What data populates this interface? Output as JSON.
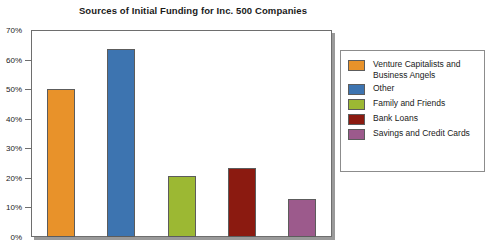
{
  "chart_data": {
    "type": "bar",
    "title": "Sources of Initial Funding for Inc. 500 Companies",
    "xlabel": "",
    "ylabel": "",
    "ylim": [
      0,
      70
    ],
    "grid": false,
    "legend_position": "right",
    "categories": [
      "Venture Capitalists and Business Angels",
      "Other",
      "Family and Friends",
      "Bank Loans",
      "Savings and Credit Cards"
    ],
    "values": [
      50,
      63.5,
      20.5,
      23.5,
      13
    ],
    "colors": [
      "#E8922A",
      "#3D74B0",
      "#9CB833",
      "#8B1A10",
      "#9C5A8C"
    ],
    "y_tick_labels": [
      "70%",
      "60%",
      "50%",
      "40%",
      "30%",
      "20%",
      "10%",
      "0%"
    ],
    "y_tick_values": [
      70,
      60,
      50,
      40,
      30,
      20,
      10,
      0
    ]
  },
  "legend": {
    "entries": [
      {
        "label": "Venture Capitalists and Business Angels",
        "color": "#E8922A"
      },
      {
        "label": "Other",
        "color": "#3D74B0"
      },
      {
        "label": "Family and Friends",
        "color": "#9CB833"
      },
      {
        "label": "Bank Loans",
        "color": "#8B1A10"
      },
      {
        "label": "Savings and Credit Cards",
        "color": "#9C5A8C"
      }
    ]
  }
}
